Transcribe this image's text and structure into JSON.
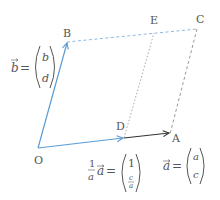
{
  "diagram": {
    "title": "",
    "colors": {
      "vector_a": "#333333",
      "vector_b": "#5b9bd5",
      "vector_od": "#5b9bd5",
      "dashed_blue": "#8fb8dc",
      "dashed_gray": "#aaaaaa",
      "text": "#555555"
    },
    "points": {
      "O": {
        "label": "O",
        "x": 38,
        "y": 148
      },
      "A": {
        "label": "A",
        "x": 170,
        "y": 134
      },
      "B": {
        "label": "B",
        "x": 67,
        "y": 42
      },
      "C": {
        "label": "C",
        "x": 197,
        "y": 29
      },
      "D": {
        "label": "D",
        "x": 124,
        "y": 138
      },
      "E": {
        "label": "E",
        "x": 154,
        "y": 33
      }
    },
    "edges": [
      {
        "from": "O",
        "to": "B",
        "style": "solid-arrow",
        "color": "blue"
      },
      {
        "from": "O",
        "to": "D",
        "style": "solid-arrow",
        "color": "blue"
      },
      {
        "from": "D",
        "to": "A",
        "style": "solid-arrow",
        "color": "dark"
      },
      {
        "from": "B",
        "to": "C",
        "style": "dashed",
        "color": "blue"
      },
      {
        "from": "C",
        "to": "A",
        "style": "dashed",
        "color": "gray"
      },
      {
        "from": "D",
        "to": "E",
        "style": "dotted",
        "color": "gray"
      }
    ],
    "annotations": {
      "b_vec": {
        "lhs": "b",
        "eq": "=",
        "top": "b",
        "bottom": "d"
      },
      "a_vec": {
        "lhs": "a",
        "eq": "=",
        "top": "a",
        "bottom": "c"
      },
      "unit_vec": {
        "coef_num": "1",
        "coef_den": "a",
        "lhs": "a",
        "eq": "=",
        "top": "1",
        "bottom_num": "c",
        "bottom_den": "a"
      }
    }
  }
}
